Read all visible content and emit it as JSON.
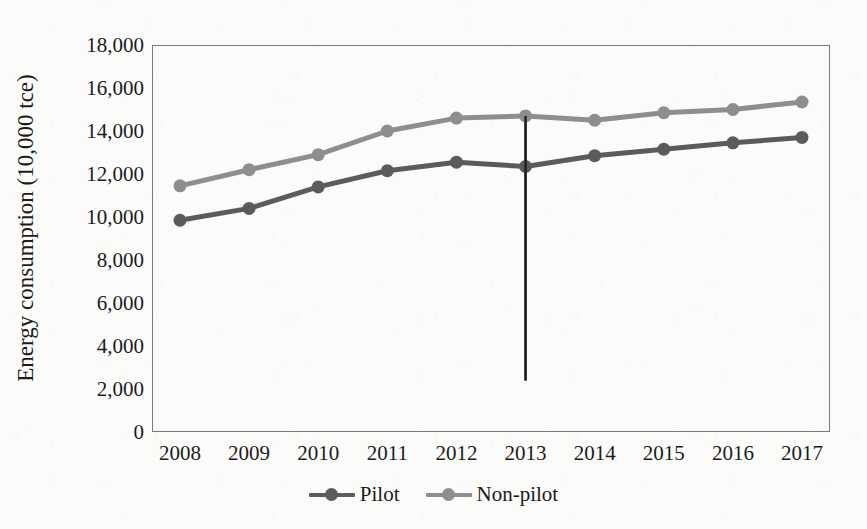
{
  "chart_data": {
    "type": "line",
    "title": "",
    "xlabel": "",
    "ylabel": "Energy consumption (10,000 tce)",
    "categories": [
      "2008",
      "2009",
      "2010",
      "2011",
      "2012",
      "2013",
      "2014",
      "2015",
      "2016",
      "2017"
    ],
    "x": [
      2008,
      2009,
      2010,
      2011,
      2012,
      2013,
      2014,
      2015,
      2016,
      2017
    ],
    "ylim": [
      0,
      18000
    ],
    "yticks": [
      0,
      2000,
      4000,
      6000,
      8000,
      10000,
      12000,
      14000,
      16000,
      18000
    ],
    "ytick_labels": [
      "0",
      "2,000",
      "4,000",
      "6,000",
      "8,000",
      "10,000",
      "12,000",
      "14,000",
      "16,000",
      "18,000"
    ],
    "grid": false,
    "legend_position": "bottom-center",
    "series": [
      {
        "name": "Pilot",
        "color": "#5b5b5b",
        "marker": "circle",
        "values": [
          9850,
          10400,
          11400,
          12150,
          12550,
          12350,
          12850,
          13150,
          13450,
          13700
        ]
      },
      {
        "name": "Non-pilot",
        "color": "#8e8e8e",
        "marker": "circle",
        "values": [
          11450,
          12200,
          12900,
          14000,
          14600,
          14700,
          14500,
          14850,
          15000,
          15350
        ]
      }
    ],
    "annotations": [
      {
        "kind": "vertical-line",
        "label": "policy-year-marker-2013",
        "x": "2013",
        "y_top": 14700,
        "y_bottom": 2400,
        "color": "#1b1b1b"
      }
    ]
  },
  "axes": {
    "y_title": "Energy consumption (10,000 tce)",
    "frame_color": "#7a7a7a"
  },
  "legend": {
    "items": [
      {
        "label": "Pilot",
        "color": "#5b5b5b"
      },
      {
        "label": "Non-pilot",
        "color": "#8e8e8e"
      }
    ]
  }
}
